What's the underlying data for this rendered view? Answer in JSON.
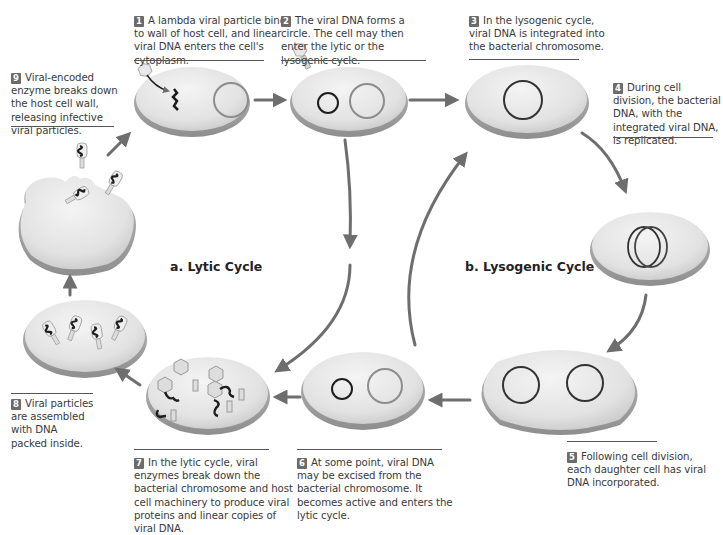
{
  "diagram": {
    "panels": {
      "lytic": {
        "title": "a. Lytic Cycle"
      },
      "lysogenic": {
        "title": "b. Lysogenic Cycle"
      }
    },
    "steps": [
      {
        "number": "1",
        "text": "A lambda viral particle binds to wall of host cell, and linear viral DNA enters the cell's cytoplasm."
      },
      {
        "number": "2",
        "text": "The viral DNA forms a circle. The cell may then enter the lytic or the lysogenic cycle."
      },
      {
        "number": "3",
        "text": "In the lysogenic cycle, viral DNA is integrated into the bacterial chromosome."
      },
      {
        "number": "4",
        "text": "During cell division, the bacterial DNA, with the integrated viral DNA, is replicated."
      },
      {
        "number": "5",
        "text": "Following cell division, each daughter cell has viral DNA incorporated."
      },
      {
        "number": "6",
        "text": "At some point, viral DNA may be excised from the bacterial chromosome. It becomes active and enters the lytic cycle."
      },
      {
        "number": "7",
        "text": "In the lytic cycle, viral enzymes break down the bacterial chromosome and host cell machinery to produce viral proteins and linear copies of viral DNA."
      },
      {
        "number": "8",
        "text": "Viral particles are assembled with DNA packed inside."
      },
      {
        "number": "9",
        "text": "Viral-encoded enzyme breaks down the host cell wall, releasing infective viral particles."
      }
    ],
    "colors": {
      "cell_fill": "#e4e4e4",
      "cell_edge": "#a8a8a8",
      "arrow": "#6e6e6e",
      "dna": "#1e1e1e",
      "badge": "#6b6b6b"
    }
  }
}
